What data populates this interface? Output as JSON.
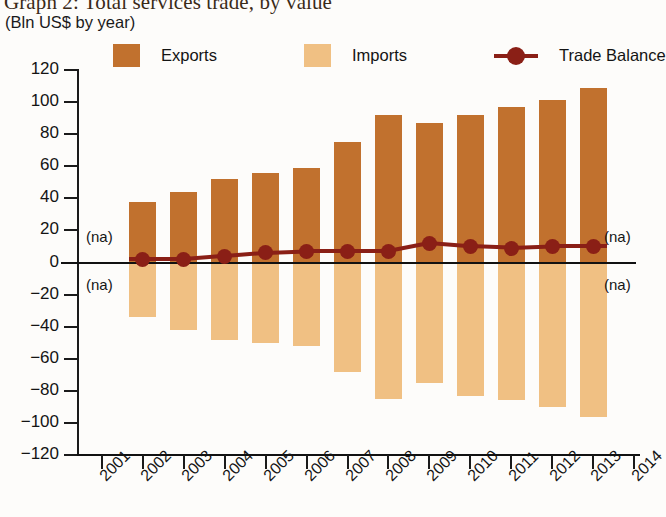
{
  "chart_data": {
    "type": "bar",
    "title": "Graph 2: Total services trade, by value",
    "subtitle": "(Bln US$ by year)",
    "xlabel": "",
    "ylabel": "",
    "ylim": [
      -120,
      120
    ],
    "ytick_labels": [
      "120",
      "100",
      "80",
      "60",
      "40",
      "20",
      "0",
      "−20",
      "−40",
      "−60",
      "−80",
      "−100",
      "−120"
    ],
    "ytick_values": [
      120,
      100,
      80,
      60,
      40,
      20,
      0,
      -20,
      -40,
      -60,
      -80,
      -100,
      -120
    ],
    "grid": false,
    "legend_position": "top",
    "x": [
      "2001",
      "2002",
      "2003",
      "2004",
      "2005",
      "2006",
      "2007",
      "2008",
      "2009",
      "2010",
      "2011",
      "2012",
      "2013",
      "2014"
    ],
    "categories": [
      "2002",
      "2003",
      "2004",
      "2005",
      "2006",
      "2007",
      "2008",
      "2009",
      "2010",
      "2011",
      "2012",
      "2013"
    ],
    "series": [
      {
        "name": "Exports",
        "type": "bar",
        "color": "#c1712e",
        "values": [
          38,
          44,
          52,
          56,
          59,
          75,
          92,
          87,
          92,
          97,
          101,
          109
        ]
      },
      {
        "name": "Imports",
        "type": "bar",
        "color": "#f0c083",
        "values": [
          -34,
          -42,
          -48,
          -50,
          -52,
          -68,
          -85,
          -75,
          -83,
          -86,
          -90,
          -96
        ]
      },
      {
        "name": "Trade Balance",
        "type": "line",
        "color": "#8a1f16",
        "values": [
          2,
          2,
          4,
          6,
          7,
          7,
          7,
          12,
          10,
          9,
          10,
          10
        ]
      }
    ],
    "annotations": [
      {
        "text": "(na)",
        "side": "left",
        "position": "above-zero"
      },
      {
        "text": "(na)",
        "side": "left",
        "position": "below-zero"
      },
      {
        "text": "(na)",
        "side": "right",
        "position": "above-zero"
      },
      {
        "text": "(na)",
        "side": "right",
        "position": "below-zero"
      }
    ]
  },
  "legend": {
    "items": [
      {
        "label": "Exports",
        "swatch": "#c1712e",
        "marker": "square"
      },
      {
        "label": "Imports",
        "swatch": "#f0c083",
        "marker": "square"
      },
      {
        "label": "Trade Balance",
        "swatch": "#8a1f16",
        "marker": "line-dot"
      }
    ]
  }
}
